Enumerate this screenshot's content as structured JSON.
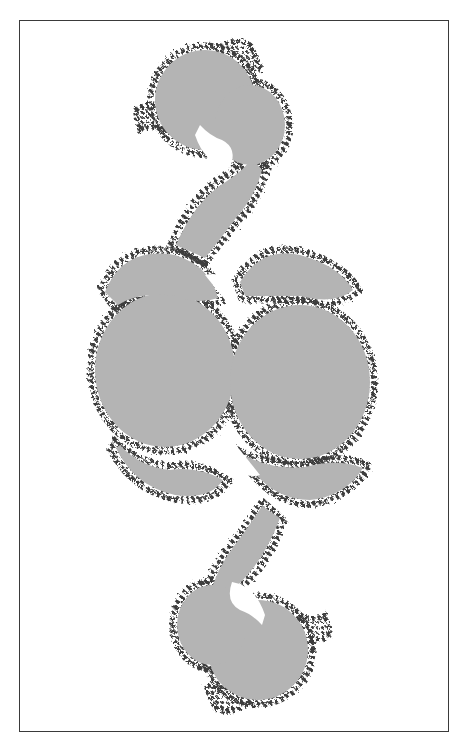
{
  "figure": {
    "frame": {
      "x": 19,
      "y": 20,
      "width": 430,
      "height": 712
    },
    "colors": {
      "background": "#ffffff",
      "fill": "#b4b4b4",
      "boundary": "#3c3c3c",
      "frame": "#3a3a3a"
    }
  }
}
